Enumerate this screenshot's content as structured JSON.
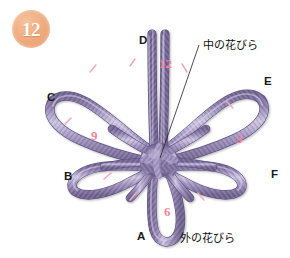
{
  "figure": {
    "step_number": "12",
    "title_alt": "",
    "background_color": "#ffffff",
    "cord_color": "#8a7bab",
    "cord_highlight": "#c9c0dd",
    "badge_color": "#e49a68",
    "marker_color": "#1a1a1a",
    "clock_color": "#f0849d"
  },
  "point_labels": [
    {
      "id": "D",
      "text": "D",
      "x": 139,
      "y": 35
    },
    {
      "id": "E",
      "text": "E",
      "x": 264,
      "y": 76
    },
    {
      "id": "C",
      "text": "C",
      "x": 47,
      "y": 92
    },
    {
      "id": "B",
      "text": "B",
      "x": 64,
      "y": 171
    },
    {
      "id": "F",
      "text": "F",
      "x": 271,
      "y": 169
    },
    {
      "id": "A",
      "text": "A",
      "x": 137,
      "y": 231
    }
  ],
  "clock_numbers": [
    {
      "id": "twelve",
      "text": "12",
      "x": 159,
      "y": 57
    },
    {
      "id": "three",
      "text": "3",
      "x": 236,
      "y": 132
    },
    {
      "id": "nine",
      "text": "9",
      "x": 91,
      "y": 129
    },
    {
      "id": "six",
      "text": "6",
      "x": 164,
      "y": 205
    }
  ],
  "annotations": [
    {
      "id": "inner-petal",
      "text": "中の花びら",
      "x": 203,
      "y": 40,
      "leader": true
    },
    {
      "id": "outer-petal",
      "text": "外の花びら",
      "x": 180,
      "y": 233,
      "leader": false
    }
  ],
  "tick_marks": [
    {
      "x": 93,
      "y": 68,
      "rot": 28
    },
    {
      "x": 133,
      "y": 62,
      "rot": 10
    },
    {
      "x": 185,
      "y": 69,
      "rot": -22
    },
    {
      "x": 230,
      "y": 105,
      "rot": -34
    },
    {
      "x": 107,
      "y": 175,
      "rot": 22
    },
    {
      "x": 133,
      "y": 196,
      "rot": 32
    },
    {
      "x": 201,
      "y": 196,
      "rot": -30
    },
    {
      "x": 68,
      "y": 121,
      "rot": 12
    }
  ],
  "petals": [
    {
      "id": "petal-D",
      "label": "D",
      "kind": "inner",
      "angle": -90
    },
    {
      "id": "petal-E",
      "label": "E",
      "kind": "outer",
      "angle": -32
    },
    {
      "id": "petal-F",
      "label": "F",
      "kind": "outer",
      "angle": 28
    },
    {
      "id": "petal-A",
      "label": "A",
      "kind": "outer",
      "angle": 90
    },
    {
      "id": "petal-B",
      "label": "B",
      "kind": "outer",
      "angle": 152
    },
    {
      "id": "petal-C",
      "label": "C",
      "kind": "outer",
      "angle": -152
    }
  ]
}
